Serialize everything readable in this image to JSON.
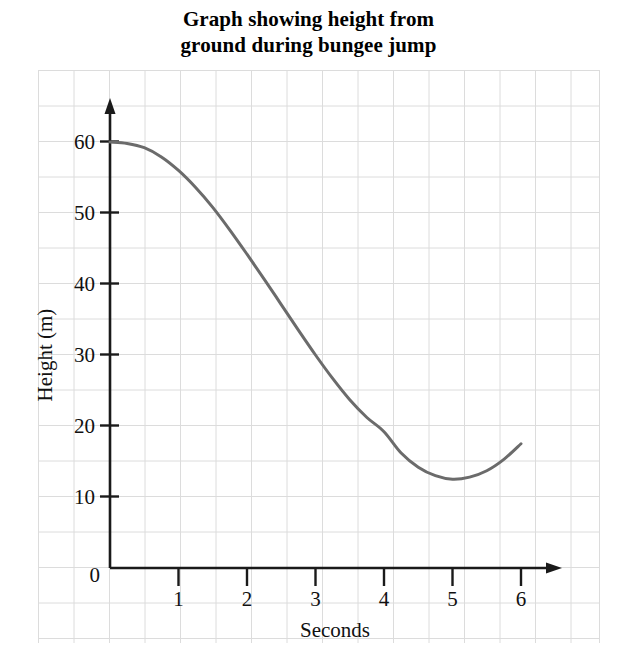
{
  "chart_data": {
    "type": "line",
    "title": "Graph showing height from ground during bungee jump",
    "title_line1": "Graph showing height from",
    "title_line2": "ground during bungee jump",
    "xlabel": "Seconds",
    "ylabel": "Height (m)",
    "xlim": [
      0,
      6.2
    ],
    "ylim": [
      0,
      63
    ],
    "xticks": [
      "0",
      "1",
      "2",
      "3",
      "4",
      "5",
      "6"
    ],
    "xtick_values": [
      0,
      1,
      2,
      3,
      4,
      5,
      6
    ],
    "yticks": [
      "0",
      "10",
      "20",
      "30",
      "40",
      "50",
      "60"
    ],
    "ytick_values": [
      0,
      10,
      20,
      30,
      40,
      50,
      60
    ],
    "grid": true,
    "grid_color": "#dcdcdc",
    "background": "#ffffff",
    "legend": null,
    "series": [
      {
        "name": "height",
        "color": "#6b6b6b",
        "line_width": 3,
        "x": [
          0,
          0.25,
          0.5,
          0.75,
          1,
          1.25,
          1.5,
          1.75,
          2,
          2.25,
          2.5,
          2.75,
          3,
          3.25,
          3.5,
          3.75,
          4,
          4.25,
          4.5,
          4.75,
          5,
          5.25,
          5.5,
          5.75,
          6
        ],
        "values": [
          60,
          59.8,
          59.2,
          57.9,
          56,
          53.6,
          50.8,
          47.6,
          44.2,
          40.7,
          37.1,
          33.5,
          30,
          26.7,
          23.7,
          21.2,
          19.2,
          16.2,
          14.2,
          13,
          12.5,
          12.8,
          13.7,
          15.3,
          17.5
        ]
      }
    ],
    "annotations": {
      "start_point": "60 m at 0 s",
      "minimum_point": "12.5 m at about 5 s",
      "end_point": "17.5 m at 6 s"
    }
  },
  "axes": {
    "x_axis_arrow": true,
    "y_axis_arrow": true,
    "axis_color": "#1a1a1a"
  }
}
